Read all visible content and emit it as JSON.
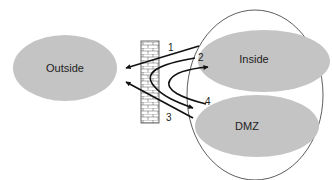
{
  "diagram": {
    "type": "network-zones-firewall",
    "zones": [
      {
        "id": "outside",
        "label": "Outside"
      },
      {
        "id": "inside",
        "label": "Inside"
      },
      {
        "id": "dmz",
        "label": "DMZ"
      }
    ],
    "flows": [
      {
        "label": "1",
        "from": "inside",
        "to": "outside"
      },
      {
        "label": "2",
        "from": "inside",
        "to": "dmz"
      },
      {
        "label": "3",
        "from": "dmz",
        "to": "outside"
      },
      {
        "label": "4",
        "from": "dmz",
        "to": "inside"
      }
    ],
    "colors": {
      "zone_fill": "#c4c4c4",
      "stroke": "#111111",
      "firewall_fill": "#ffffff"
    }
  }
}
